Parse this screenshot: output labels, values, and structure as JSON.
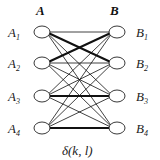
{
  "diagram": {
    "set_a_label": "A",
    "set_b_label": "B",
    "left_nodes": [
      {
        "name": "A",
        "sub": "1"
      },
      {
        "name": "A",
        "sub": "2"
      },
      {
        "name": "A",
        "sub": "3"
      },
      {
        "name": "A",
        "sub": "4"
      }
    ],
    "right_nodes": [
      {
        "name": "B",
        "sub": "1"
      },
      {
        "name": "B",
        "sub": "2"
      },
      {
        "name": "B",
        "sub": "3"
      },
      {
        "name": "B",
        "sub": "4"
      }
    ],
    "caption": "δ(k, l)",
    "edges": "complete bipartite A×B",
    "bold_edges": [
      [
        "A1",
        "B2"
      ],
      [
        "A2",
        "B1"
      ],
      [
        "A3",
        "B3"
      ],
      [
        "A4",
        "B4"
      ]
    ]
  }
}
